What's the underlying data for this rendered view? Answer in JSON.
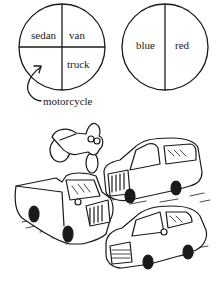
{
  "diagram": {
    "type": "partition-circles",
    "colors": {
      "ink": "#1a1a1a",
      "background": "#ffffff"
    },
    "left_circle": {
      "name": "vehicle-type",
      "center": [
        62,
        47
      ],
      "radius": 43,
      "divisions": "quadrants",
      "sections": [
        {
          "id": "top-left",
          "label": "sedan"
        },
        {
          "id": "top-right",
          "label": "van"
        },
        {
          "id": "bottom-right",
          "label": "truck"
        },
        {
          "id": "bottom-left",
          "label": ""
        }
      ]
    },
    "right_circle": {
      "name": "vehicle-color",
      "center": [
        165,
        47
      ],
      "radius": 43,
      "divisions": "halves-vertical",
      "sections": [
        {
          "id": "left",
          "label": "blue"
        },
        {
          "id": "right",
          "label": "red"
        }
      ]
    },
    "callout": {
      "label": "motorcycle",
      "points_to": "left_circle.bottom-left"
    },
    "illustration": {
      "description": "cartoon of parked vehicles",
      "items": [
        "motorcycle",
        "van",
        "pickup truck",
        "sedan"
      ]
    }
  }
}
